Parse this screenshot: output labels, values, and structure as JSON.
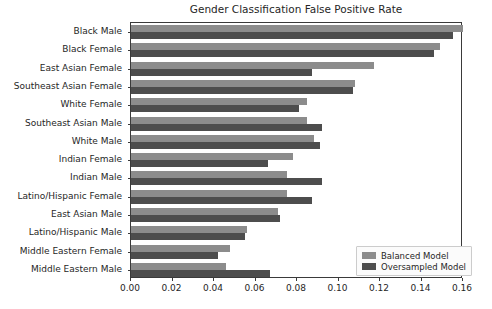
{
  "chart_data": {
    "type": "bar",
    "orientation": "horizontal",
    "title": "Gender Classification False Positive Rate",
    "xlabel": "",
    "ylabel": "",
    "xlim": [
      0.0,
      0.16
    ],
    "xticks": [
      "0.00",
      "0.02",
      "0.04",
      "0.06",
      "0.08",
      "0.10",
      "0.12",
      "0.14",
      "0.16"
    ],
    "xtick_values": [
      0.0,
      0.02,
      0.04,
      0.06,
      0.08,
      0.1,
      0.12,
      0.14,
      0.16
    ],
    "grid": false,
    "legend_position": "lower right",
    "categories": [
      "Black Male",
      "Black Female",
      "East Asian Female",
      "Southeast Asian Female",
      "White Female",
      "Southeast Asian Male",
      "White Male",
      "Indian Female",
      "Indian Male",
      "Latino/Hispanic Female",
      "East Asian Male",
      "Latino/Hispanic Male",
      "Middle Eastern Female",
      "Middle Eastern Male"
    ],
    "series": [
      {
        "name": "Balanced Model",
        "color": "#8c8c8c",
        "values": [
          0.16,
          0.149,
          0.117,
          0.108,
          0.085,
          0.085,
          0.088,
          0.078,
          0.075,
          0.075,
          0.071,
          0.056,
          0.0475,
          0.046
        ]
      },
      {
        "name": "Oversampled Model",
        "color": "#4d4d4d",
        "values": [
          0.155,
          0.146,
          0.087,
          0.107,
          0.081,
          0.092,
          0.091,
          0.066,
          0.092,
          0.087,
          0.072,
          0.055,
          0.042,
          0.067
        ]
      }
    ]
  }
}
